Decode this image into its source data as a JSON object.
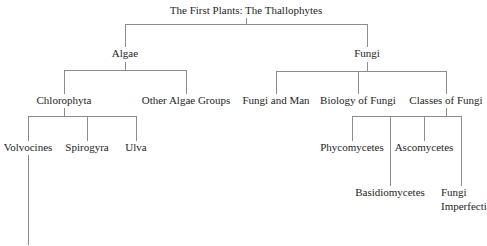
{
  "diagram": {
    "type": "tree",
    "root": {
      "label": "The First Plants: The Thallophytes",
      "children": [
        {
          "label": "Algae",
          "children": [
            {
              "label": "Chlorophyta",
              "children": [
                {
                  "label": "Volvocines"
                },
                {
                  "label": "Spirogyra"
                },
                {
                  "label": "Ulva"
                }
              ]
            },
            {
              "label": "Other Algae Groups"
            }
          ]
        },
        {
          "label": "Fungi",
          "children": [
            {
              "label": "Fungi and Man"
            },
            {
              "label": "Biology of Fungi"
            },
            {
              "label": "Classes of Fungi",
              "children": [
                {
                  "label": "Phycomycetes"
                },
                {
                  "label": "Ascomycetes"
                },
                {
                  "label": "Basidiomycetes"
                },
                {
                  "label": "Fungi Imperfecti"
                }
              ]
            }
          ]
        }
      ]
    }
  },
  "labels": {
    "title": "The First Plants: The Thallophytes",
    "algae": "Algae",
    "fungi": "Fungi",
    "chlorophyta": "Chlorophyta",
    "other_algae": "Other Algae Groups",
    "fungi_and_man": "Fungi and Man",
    "biology_of_fungi": "Biology of Fungi",
    "classes_of_fungi": "Classes of Fungi",
    "volvocines": "Volvocines",
    "spirogyra": "Spirogyra",
    "ulva": "Ulva",
    "phycomycetes": "Phycomycetes",
    "ascomycetes": "Ascomycetes",
    "basidiomycetes": "Basidiomycetes",
    "fungi_imperfecti_1": "Fungi",
    "fungi_imperfecti_2": "Imperfecti"
  }
}
